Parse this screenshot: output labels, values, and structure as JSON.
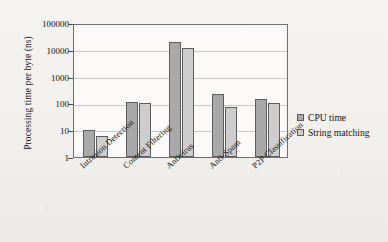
{
  "chart_data": {
    "type": "bar",
    "title": "",
    "xlabel": "",
    "ylabel": "Processing time per byte (ns)",
    "categories": [
      "Intrusion Detection",
      "Content Filtering",
      "Antivirus",
      "Anti-Spam",
      "P2P Classification"
    ],
    "series": [
      {
        "name": "CPU time",
        "values": [
          10,
          110,
          20000,
          220,
          150
        ],
        "color": "#a9a9a9"
      },
      {
        "name": "String matching",
        "values": [
          6,
          100,
          12000,
          72,
          105
        ],
        "color": "#cdcdcd"
      }
    ],
    "yscale": "log",
    "ylim": [
      1,
      100000
    ],
    "yticks": [
      "100000",
      "10000",
      "1000",
      "100",
      "10",
      "1"
    ],
    "ytick_values": [
      100000,
      10000,
      1000,
      100,
      10,
      1
    ],
    "grid": true,
    "legend_position": "right",
    "legend": [
      "CPU time",
      "String matching"
    ]
  }
}
